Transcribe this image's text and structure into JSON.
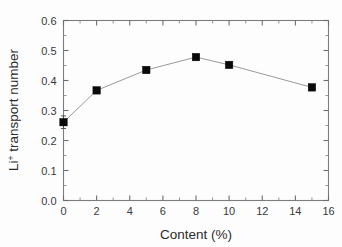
{
  "chart_data": {
    "type": "line",
    "title": "",
    "xlabel": "Content (%)",
    "ylabel": "Li+ transport number",
    "ylabel_base": "Li",
    "ylabel_superscript": "+",
    "ylabel_rest": " transport number",
    "xlim": [
      0,
      16
    ],
    "ylim": [
      0.0,
      0.6
    ],
    "grid": false,
    "legend": null,
    "xticks": [
      0,
      2,
      4,
      6,
      8,
      10,
      12,
      14,
      16
    ],
    "xtick_labels": [
      "0",
      "2",
      "4",
      "6",
      "8",
      "10",
      "12",
      "14",
      "16"
    ],
    "xminor_step": 1,
    "yticks": [
      0.0,
      0.1,
      0.2,
      0.3,
      0.4,
      0.5,
      0.6
    ],
    "ytick_labels": [
      "0.0",
      "0.1",
      "0.2",
      "0.3",
      "0.4",
      "0.5",
      "0.6"
    ],
    "yminor_step": 0.05,
    "marker": "filled-square",
    "marker_color": "#0a0a0a",
    "line_color": "#9a9a9a",
    "frame_color": "#7d7d7d",
    "background": "#ffffff",
    "x": [
      0,
      2,
      5,
      8,
      10,
      15
    ],
    "values": [
      0.261,
      0.367,
      0.435,
      0.478,
      0.452,
      0.377
    ],
    "yerr": [
      0.021,
      0.01,
      0.009,
      0.006,
      0.006,
      0.007
    ],
    "series": [
      {
        "name": "Li+ transport number",
        "points": [
          {
            "x": 0,
            "y": 0.261,
            "err": 0.021
          },
          {
            "x": 2,
            "y": 0.367,
            "err": 0.01
          },
          {
            "x": 5,
            "y": 0.435,
            "err": 0.009
          },
          {
            "x": 8,
            "y": 0.478,
            "err": 0.006
          },
          {
            "x": 10,
            "y": 0.452,
            "err": 0.006
          },
          {
            "x": 15,
            "y": 0.377,
            "err": 0.007
          }
        ]
      }
    ]
  }
}
